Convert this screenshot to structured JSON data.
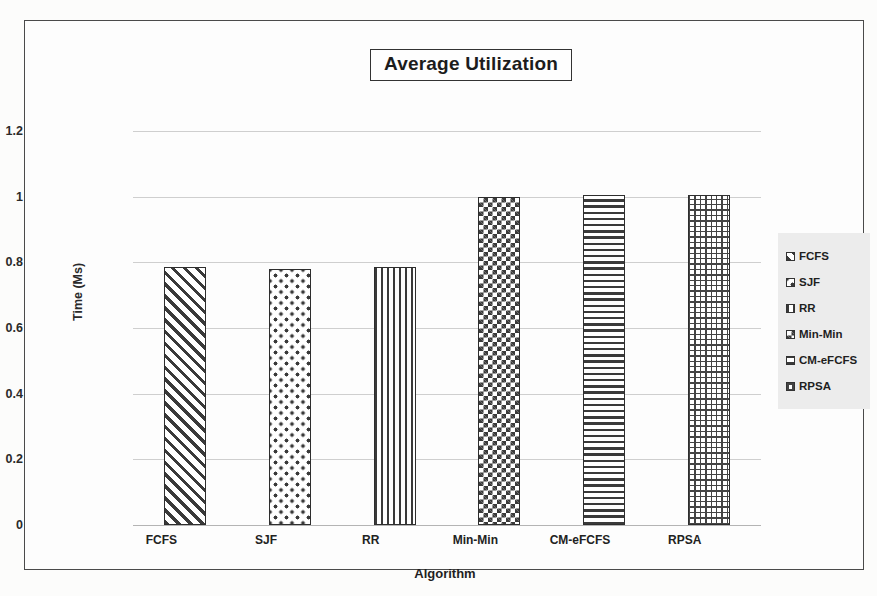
{
  "chart_data": {
    "type": "bar",
    "title": "Average Utilization",
    "xlabel": "Algorithm",
    "ylabel": "Time (Ms)",
    "categories": [
      "FCFS",
      "SJF",
      "RR",
      "Min-Min",
      "CM-eFCFS",
      "RPSA"
    ],
    "values": [
      0.785,
      0.78,
      0.785,
      1.0,
      1.005,
      1.005
    ],
    "ylim": [
      0,
      1.2
    ],
    "ytick_labels": [
      "0",
      "0.2",
      "0.4",
      "0.6",
      "0.8",
      "1",
      "1.2"
    ],
    "ytick_values": [
      0,
      0.2,
      0.4,
      0.6,
      0.8,
      1,
      1.2
    ],
    "grid": true,
    "legend_position": "right",
    "legend": [
      {
        "label": "FCFS",
        "pattern": "diagonal-stripes"
      },
      {
        "label": "SJF",
        "pattern": "diamond-dots"
      },
      {
        "label": "RR",
        "pattern": "vertical-stripes"
      },
      {
        "label": "Min-Min",
        "pattern": "checkerboard"
      },
      {
        "label": "CM-eFCFS",
        "pattern": "horizontal-stripes"
      },
      {
        "label": "RPSA",
        "pattern": "cross-grid"
      }
    ],
    "colors": {
      "bar_outline": "#2e2e2e",
      "bar_fill": "#3a3a3a",
      "gridline": "#cfcfcf",
      "frame": "#4a4a4a",
      "legend_background": "#ececec",
      "text": "#1f1f1f"
    }
  }
}
